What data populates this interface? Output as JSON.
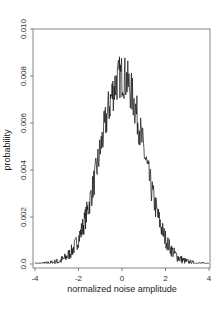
{
  "chart_data": {
    "type": "line",
    "title": "",
    "xlabel": "normalized noise amplitude",
    "ylabel": "probability",
    "xlim": [
      -4,
      4
    ],
    "ylim": [
      0.0,
      0.01
    ],
    "x_ticks": [
      -4,
      -2,
      0,
      2,
      4
    ],
    "x_tick_labels": [
      "-4",
      "-2",
      "0",
      "2",
      "4"
    ],
    "y_ticks": [
      0.0,
      0.002,
      0.004,
      0.006,
      0.008,
      0.01
    ],
    "y_tick_labels": [
      "0.0",
      "0.002",
      "0.004",
      "0.006",
      "0.008",
      "0.010"
    ],
    "grid": false,
    "legend": null,
    "series": [
      {
        "name": "noise histogram (approx. Gaussian, sigma ≈ 1)",
        "x": [
          -4.0,
          -3.5,
          -3.0,
          -2.5,
          -2.0,
          -1.5,
          -1.0,
          -0.5,
          0.0,
          0.5,
          1.0,
          1.5,
          2.0,
          2.5,
          3.0,
          3.5,
          4.0
        ],
        "values": [
          0.0001,
          0.0002,
          0.0004,
          0.001,
          0.002,
          0.0037,
          0.0055,
          0.0071,
          0.008,
          0.0071,
          0.0055,
          0.0037,
          0.002,
          0.001,
          0.0004,
          0.0002,
          0.0001
        ]
      }
    ],
    "peak_value_approx": 0.0088,
    "line_color": "#111111",
    "axis_color": "#555555"
  }
}
